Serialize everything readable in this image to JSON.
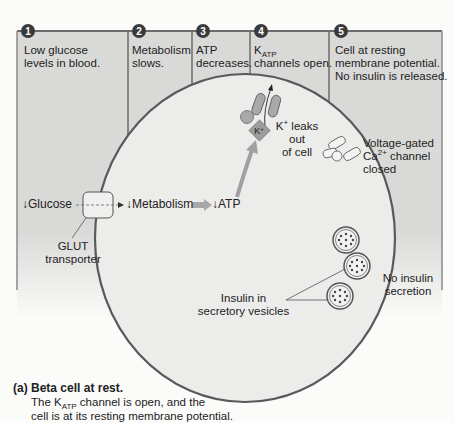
{
  "steps": [
    {
      "num": "1",
      "text_l1": "Low glucose",
      "text_l2": "levels in blood."
    },
    {
      "num": "2",
      "text_l1": "Metabolism",
      "text_l2": "slows."
    },
    {
      "num": "3",
      "text_l1": "ATP",
      "text_l2": "decreases."
    },
    {
      "num": "4",
      "text_l1_main": "K",
      "text_l1_sub": "ATP",
      "text_l2": "channels open."
    },
    {
      "num": "5",
      "text_l1": "Cell at resting",
      "text_l2": "membrane potential.",
      "text_l3": "No insulin is released."
    }
  ],
  "pathway": {
    "glucose": "Glucose",
    "metabolism": "Metabolism",
    "atp": "ATP",
    "down_arrow": "↓"
  },
  "labels": {
    "glut_l1": "GLUT",
    "glut_l2": "transporter",
    "k_ion": "K",
    "k_ion_sup": "+",
    "k_leaks_l1_main": "K",
    "k_leaks_l1_sup": "+",
    "k_leaks_l1_rest": " leaks",
    "k_leaks_l2": "out",
    "k_leaks_l3": "of cell",
    "ca_l1": "Voltage-gated",
    "ca_l2_main": "Ca",
    "ca_l2_sup": "2+",
    "ca_l2_rest": " channel",
    "ca_l3": "closed",
    "insulin_l1": "Insulin in",
    "insulin_l2": "secretory vesicles",
    "no_secretion_l1": "No insulin",
    "no_secretion_l2": "secretion"
  },
  "caption": {
    "prefix": "(a)",
    "title": "Beta cell at rest.",
    "body_l1_pre": "The K",
    "body_l1_sub": "ATP",
    "body_l1_post": " channel is open, and the",
    "body_l2": "cell is at its resting membrane potential."
  },
  "colors": {
    "panel_fill": "#d9d9d8",
    "panel_border": "#6b6b6b",
    "cell_fill": "#ececeb",
    "cell_border": "#595959",
    "step_circle": "#3a3a3a",
    "arrow_gray": "#9a9a9a"
  }
}
